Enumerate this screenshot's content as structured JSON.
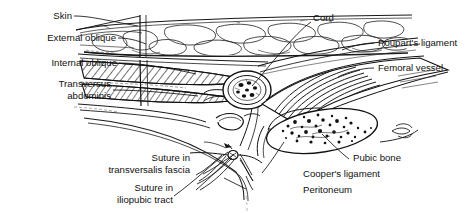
{
  "figure": {
    "background_color": "#ffffff",
    "ink_color": "#111111",
    "top_caption": "",
    "width": 465,
    "height": 213
  },
  "labels": {
    "skin": "Skin",
    "external_oblique": "External oblique",
    "internal_oblique": "Internal oblique",
    "transversus_abdominis_1": "Transversus",
    "transversus_abdominis_2": "abdominis",
    "cord": "Cord",
    "poupart": "Poupart's ligament",
    "femoral_vessel": "Femoral vessel",
    "pubic_bone": "Pubic bone",
    "coopers_ligament": "Cooper's ligament",
    "peritoneum": "Peritoneum",
    "suture_tf_1": "Suture in",
    "suture_tf_2": "transversalis fascia",
    "suture_it_1": "Suture in",
    "suture_it_2": "iliopubic tract"
  },
  "structures": [
    {
      "name": "skin",
      "label": "Skin",
      "side": "left"
    },
    {
      "name": "external-oblique",
      "label": "External oblique",
      "side": "left"
    },
    {
      "name": "internal-oblique",
      "label": "Internal oblique",
      "side": "left"
    },
    {
      "name": "transversus-abdominis",
      "label": "Transversus abdominis",
      "side": "left"
    },
    {
      "name": "cord",
      "label": "Cord",
      "side": "top"
    },
    {
      "name": "poupart-ligament",
      "label": "Poupart's ligament",
      "side": "right"
    },
    {
      "name": "femoral-vessel",
      "label": "Femoral vessel",
      "side": "right"
    },
    {
      "name": "pubic-bone",
      "label": "Pubic bone",
      "side": "right"
    },
    {
      "name": "coopers-ligament",
      "label": "Cooper's ligament",
      "side": "bottom"
    },
    {
      "name": "peritoneum",
      "label": "Peritoneum",
      "side": "bottom"
    },
    {
      "name": "suture-transversalis-fascia",
      "label": "Suture in transversalis fascia",
      "side": "bottom"
    },
    {
      "name": "suture-iliopubic-tract",
      "label": "Suture in iliopubic tract",
      "side": "bottom"
    }
  ]
}
